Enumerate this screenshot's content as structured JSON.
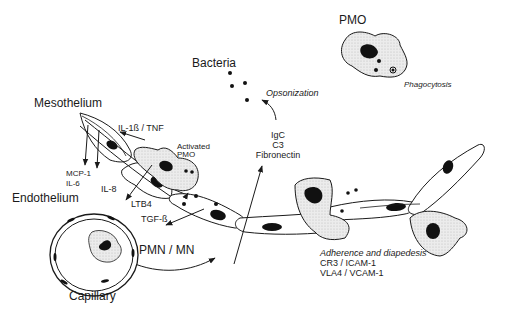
{
  "labels": {
    "pmo": "PMO",
    "bacteria": "Bacteria",
    "opsonization": "Opsonization",
    "phagocytosis": "Phagocytosis",
    "mesothelium": "Mesothelium",
    "il1_tnf": "IL-1ß / TNF",
    "activated_pmo_line1": "Activated",
    "activated_pmo_line2": "PMO",
    "mcp1": "MCP-1",
    "il6": "IL-6",
    "il8": "IL-8",
    "ltb4": "LTB4",
    "tgf": "TGF-ß",
    "endothelium": "Endothelium",
    "pmn_mn": "PMN / MN",
    "capillary": "Capillary",
    "opsonins": [
      "IgC",
      "C3",
      "Fibronectin"
    ],
    "adherence_title": "Adherence and diapedesis",
    "adherence_line1": "CR3 / ICAM-1",
    "adherence_line2": "VLA4 / VCAM-1"
  },
  "colors": {
    "line": "#1a1a1a",
    "cell_fill": "#ffffff",
    "stipple_fill": "#e4e4e4",
    "nucleus": "#111111"
  }
}
